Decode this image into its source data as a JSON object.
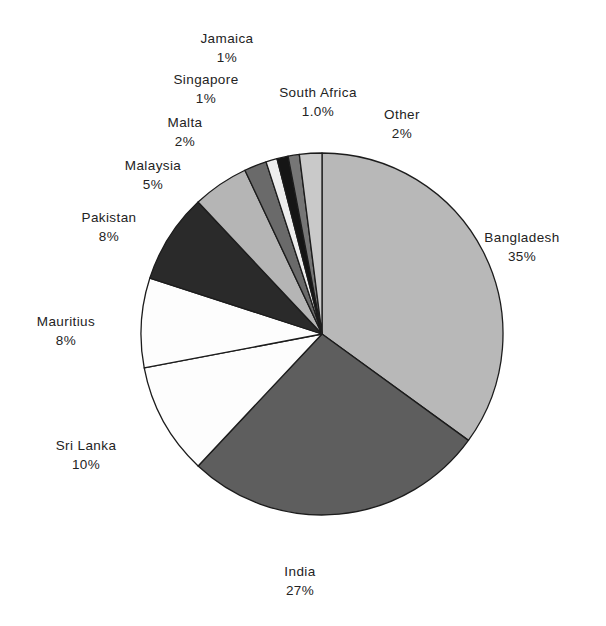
{
  "chart_data": {
    "type": "pie",
    "title": "",
    "subtitle": "",
    "xlabel": "",
    "ylabel": "",
    "legend_position": "none",
    "grid": false,
    "start_angle_deg": 0,
    "direction": "clockwise",
    "categories": [
      "Bangladesh",
      "India",
      "Sri Lanka",
      "Mauritius",
      "Pakistan",
      "Malaysia",
      "Malta",
      "Singapore",
      "Jamaica",
      "South Africa",
      "Other"
    ],
    "values": [
      35,
      27,
      10,
      8,
      8,
      5,
      2,
      1,
      1,
      1,
      2
    ],
    "value_labels": [
      "35%",
      "27%",
      "10%",
      "8%",
      "8%",
      "5%",
      "2%",
      "1%",
      "1%",
      "1.0%",
      "2%"
    ],
    "colors": [
      "#b8b8b8",
      "#5e5e5e",
      "#fdfdfd",
      "#fdfdfd",
      "#2a2a2a",
      "#b5b5b5",
      "#6a6a6a",
      "#ededed",
      "#151515",
      "#767676",
      "#c9c9c9"
    ],
    "slice_outline_color": "#1c1c1c",
    "background_color": "#ffffff",
    "slices": [
      {
        "name": "Bangladesh",
        "value": 35,
        "label": "Bangladesh",
        "pct": "35%",
        "color": "#b8b8b8"
      },
      {
        "name": "India",
        "value": 27,
        "label": "India",
        "pct": "27%",
        "color": "#5e5e5e"
      },
      {
        "name": "Sri Lanka",
        "value": 10,
        "label": "Sri  Lanka",
        "pct": "10%",
        "color": "#fdfdfd"
      },
      {
        "name": "Mauritius",
        "value": 8,
        "label": "Mauritius",
        "pct": "8%",
        "color": "#fdfdfd"
      },
      {
        "name": "Pakistan",
        "value": 8,
        "label": "Pakistan",
        "pct": "8%",
        "color": "#2a2a2a"
      },
      {
        "name": "Malaysia",
        "value": 5,
        "label": "Malaysia",
        "pct": "5%",
        "color": "#b5b5b5"
      },
      {
        "name": "Malta",
        "value": 2,
        "label": "Malta",
        "pct": "2%",
        "color": "#6a6a6a"
      },
      {
        "name": "Singapore",
        "value": 1,
        "label": "Singapore",
        "pct": "1%",
        "color": "#ededed"
      },
      {
        "name": "Jamaica",
        "value": 1,
        "label": "Jamaica",
        "pct": "1%",
        "color": "#151515"
      },
      {
        "name": "South Africa",
        "value": 1,
        "label": "South  Africa",
        "pct": "1.0%",
        "color": "#767676"
      },
      {
        "name": "Other",
        "value": 2,
        "label": "Other",
        "pct": "2%",
        "color": "#c9c9c9"
      }
    ]
  },
  "labels": {
    "jamaica_name": "Jamaica",
    "jamaica_pct": "1%",
    "singapore_name": "Singapore",
    "singapore_pct": "1%",
    "south_africa_name": "South  Africa",
    "south_africa_pct": "1.0%",
    "other_name": "Other",
    "other_pct": "2%",
    "malta_name": "Malta",
    "malta_pct": "2%",
    "malaysia_name": "Malaysia",
    "malaysia_pct": "5%",
    "pakistan_name": "Pakistan",
    "pakistan_pct": "8%",
    "mauritius_name": "Mauritius",
    "mauritius_pct": "8%",
    "sri_lanka_name": "Sri  Lanka",
    "sri_lanka_pct": "10%",
    "india_name": "India",
    "india_pct": "27%",
    "bangladesh_name": "Bangladesh",
    "bangladesh_pct": "35%"
  }
}
